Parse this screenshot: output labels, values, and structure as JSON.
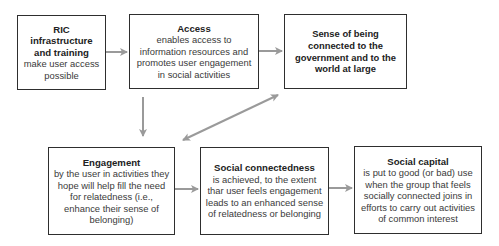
{
  "diagram": {
    "colors": {
      "box_border": "#2e2e2e",
      "arrow": "#9a9a9a",
      "text": "#2b2b2b",
      "background": "#ffffff"
    },
    "nodes": [
      {
        "id": "ric",
        "title": "RIC infrastructure and training",
        "body": "make user access possible"
      },
      {
        "id": "access",
        "title": "Access",
        "body": "enables access to information resources and promotes user engagement in social activities"
      },
      {
        "id": "sense",
        "title": "Sense of being connected to the government and to the world at large",
        "body": ""
      },
      {
        "id": "engagement",
        "title": "Engagement",
        "body": "by the user in activities they hope will help fill the need for relatedness (i.e., enhance their sense of belonging)"
      },
      {
        "id": "social_connectedness",
        "title": "Social connectedness",
        "body": "is achieved, to the extent thar user feels engagement leads to an enhanced sense of relatedness or belonging"
      },
      {
        "id": "social_capital",
        "title": "Social capital",
        "body": "is put to good (or bad) use when the group that feels socially connected joins in efforts to carry out activities of common interest"
      }
    ],
    "edges": [
      {
        "from": "ric",
        "to": "access",
        "type": "single"
      },
      {
        "from": "access",
        "to": "sense",
        "type": "single"
      },
      {
        "from": "access",
        "to": "engagement",
        "type": "single"
      },
      {
        "from": "engagement",
        "to": "sense",
        "type": "double"
      },
      {
        "from": "engagement",
        "to": "social_connectedness",
        "type": "single"
      },
      {
        "from": "social_connectedness",
        "to": "social_capital",
        "type": "single"
      }
    ]
  }
}
